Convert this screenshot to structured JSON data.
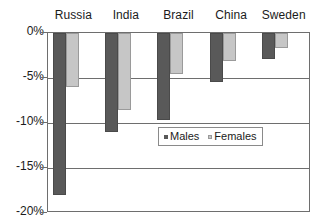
{
  "chart_data": {
    "type": "bar",
    "title": "",
    "subtitle": "",
    "xlabel": "",
    "ylabel": "",
    "categories": [
      "Russia",
      "India",
      "Brazil",
      "China",
      "Sweden"
    ],
    "series": [
      {
        "name": "Males",
        "color": "#595959",
        "values": [
          -18.0,
          -11.0,
          -9.7,
          -5.4,
          -2.9
        ]
      },
      {
        "name": "Females",
        "color": "#c6c6c6",
        "values": [
          -6.0,
          -8.5,
          -4.5,
          -3.1,
          -1.7
        ]
      }
    ],
    "ylim": [
      -20,
      0
    ],
    "ytick_labels": [
      "0%",
      "-5%",
      "-10%",
      "-15%",
      "-20%"
    ],
    "ytick_values": [
      0,
      -5,
      -10,
      -15,
      -20
    ],
    "grid": true,
    "legend_position": "center",
    "legend_entries": [
      "Males",
      "Females"
    ],
    "annotations": []
  }
}
